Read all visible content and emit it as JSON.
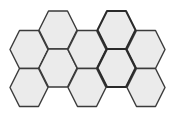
{
  "diagram": {
    "type": "hexagonal-grid",
    "orientation": "flat-top",
    "hex_half_width": 19,
    "hex_half_height": 19,
    "colors": {
      "fill": "#ebebeb",
      "stroke": "#3a3a3a",
      "background": "#ffffff"
    },
    "cells": [
      {
        "id": "c0-r0",
        "col": 0,
        "cx": 29,
        "cy": 49.5,
        "bold": false
      },
      {
        "id": "c0-r1",
        "col": 0,
        "cx": 29,
        "cy": 87.5,
        "bold": false
      },
      {
        "id": "c1-r0",
        "col": 1,
        "cx": 58,
        "cy": 30,
        "bold": false
      },
      {
        "id": "c1-r1",
        "col": 1,
        "cx": 58,
        "cy": 68,
        "bold": false
      },
      {
        "id": "c2-r0",
        "col": 2,
        "cx": 87,
        "cy": 49.5,
        "bold": false
      },
      {
        "id": "c2-r1",
        "col": 2,
        "cx": 87,
        "cy": 87.5,
        "bold": false
      },
      {
        "id": "c3-r0",
        "col": 3,
        "cx": 116.5,
        "cy": 30,
        "bold": true
      },
      {
        "id": "c3-r1",
        "col": 3,
        "cx": 116.5,
        "cy": 68,
        "bold": true
      },
      {
        "id": "c4-r0",
        "col": 4,
        "cx": 146,
        "cy": 49.5,
        "bold": false
      },
      {
        "id": "c4-r1",
        "col": 4,
        "cx": 146,
        "cy": 87.5,
        "bold": false
      }
    ]
  }
}
